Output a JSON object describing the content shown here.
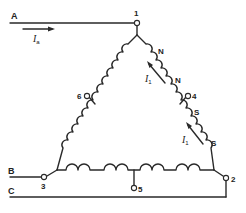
{
  "diagram": {
    "type": "three-phase delta winding with taps",
    "colors": {
      "line": "#2a2a2a",
      "background": "#ffffff"
    },
    "lines": [
      {
        "id": "A",
        "label": "A"
      },
      {
        "id": "B",
        "label": "B"
      },
      {
        "id": "C",
        "label": "C"
      }
    ],
    "terminals": [
      {
        "id": "1",
        "label": "1"
      },
      {
        "id": "2",
        "label": "2"
      },
      {
        "id": "3",
        "label": "3"
      },
      {
        "id": "4",
        "label": "4"
      },
      {
        "id": "5",
        "label": "5"
      },
      {
        "id": "6",
        "label": "6"
      }
    ],
    "currents": {
      "line_current": {
        "symbol": "I",
        "subscript": "a"
      },
      "phase_current_1": {
        "symbol": "I",
        "subscript": "1"
      },
      "phase_current_2": {
        "symbol": "I",
        "subscript": "1"
      }
    },
    "pole_labels": [
      "N",
      "N",
      "S",
      "S"
    ]
  }
}
